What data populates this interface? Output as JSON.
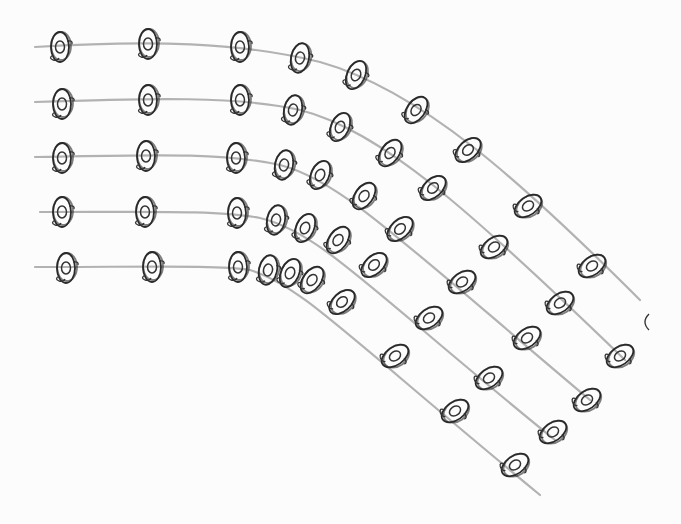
{
  "colors": {
    "paper": "#fcfcfc",
    "graphite_line": "#9a9a9a",
    "ink": "#2a2a2a"
  },
  "paths": [
    {
      "d": "M35,47 C150,40 240,42 320,62 C420,90 520,180 640,300",
      "figures": [
        [
          60,
          47
        ],
        [
          148,
          44
        ],
        [
          240,
          47
        ],
        [
          300,
          58
        ],
        [
          356,
          75
        ],
        [
          416,
          110
        ],
        [
          468,
          150
        ],
        [
          528,
          206
        ],
        [
          592,
          266
        ]
      ]
    },
    {
      "d": "M35,102 C150,98 240,96 300,110 C380,130 470,210 625,360",
      "figures": [
        [
          62,
          104
        ],
        [
          148,
          100
        ],
        [
          240,
          100
        ],
        [
          293,
          110
        ],
        [
          340,
          127
        ],
        [
          390,
          153
        ],
        [
          433,
          188
        ],
        [
          494,
          247
        ],
        [
          560,
          303
        ],
        [
          620,
          356
        ]
      ]
    },
    {
      "d": "M35,157 C150,155 220,152 280,165 C340,180 400,240 590,400",
      "figures": [
        [
          62,
          158
        ],
        [
          146,
          156
        ],
        [
          236,
          158
        ],
        [
          284,
          165
        ],
        [
          320,
          175
        ],
        [
          364,
          196
        ],
        [
          400,
          229
        ],
        [
          462,
          282
        ],
        [
          527,
          338
        ],
        [
          587,
          400
        ]
      ]
    },
    {
      "d": "M40,212 C150,212 220,210 260,218 C320,232 370,290 555,440",
      "figures": [
        [
          62,
          212
        ],
        [
          145,
          212
        ],
        [
          237,
          213
        ],
        [
          276,
          220
        ],
        [
          305,
          228
        ],
        [
          338,
          240
        ],
        [
          374,
          265
        ],
        [
          429,
          318
        ],
        [
          489,
          378
        ],
        [
          553,
          432
        ]
      ]
    },
    {
      "d": "M35,267 C150,267 220,265 250,270 C300,285 340,330 540,495",
      "figures": [
        [
          66,
          268
        ],
        [
          152,
          267
        ],
        [
          238,
          267
        ],
        [
          268,
          270
        ],
        [
          290,
          273
        ],
        [
          312,
          280
        ],
        [
          342,
          302
        ],
        [
          395,
          356
        ],
        [
          455,
          411
        ],
        [
          515,
          465
        ]
      ]
    }
  ],
  "stray_mark": [
    645,
    322
  ]
}
